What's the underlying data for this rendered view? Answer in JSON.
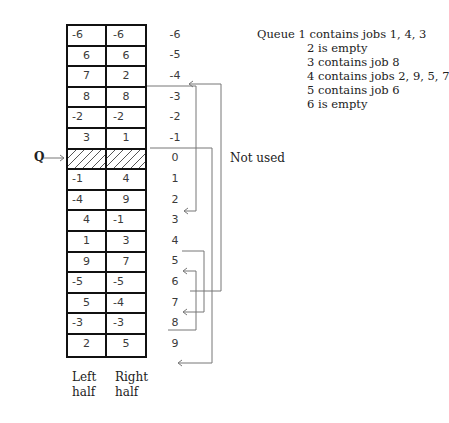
{
  "diagram": {
    "pointer_label": "Q",
    "not_used_label": "Not used",
    "column_labels": {
      "left": [
        "Left",
        "half"
      ],
      "right": [
        "Right",
        "half"
      ]
    },
    "rows": [
      {
        "index": "-6",
        "left": "-6",
        "right": "-6"
      },
      {
        "index": "-5",
        "left": "6",
        "right": "6"
      },
      {
        "index": "-4",
        "left": "7",
        "right": "2"
      },
      {
        "index": "-3",
        "left": "8",
        "right": "8"
      },
      {
        "index": "-2",
        "left": "-2",
        "right": "-2"
      },
      {
        "index": "-1",
        "left": "3",
        "right": "1"
      },
      {
        "index": "0",
        "left": "",
        "right": "",
        "hatched": true
      },
      {
        "index": "1",
        "left": "-1",
        "right": "4"
      },
      {
        "index": "2",
        "left": "-4",
        "right": "9"
      },
      {
        "index": "3",
        "left": "4",
        "right": "-1"
      },
      {
        "index": "4",
        "left": "1",
        "right": "3"
      },
      {
        "index": "5",
        "left": "9",
        "right": "7"
      },
      {
        "index": "6",
        "left": "-5",
        "right": "-5"
      },
      {
        "index": "7",
        "left": "5",
        "right": "-4"
      },
      {
        "index": "8",
        "left": "-3",
        "right": "-3"
      },
      {
        "index": "9",
        "left": "2",
        "right": "5"
      }
    ],
    "links": [
      {
        "from": "-3",
        "to": "3"
      },
      {
        "from": "0",
        "to": "9"
      },
      {
        "from": "6",
        "to": "-4"
      },
      {
        "from": "4",
        "to": "8"
      },
      {
        "from": "8",
        "to": "5"
      }
    ]
  },
  "legend": {
    "lines": [
      {
        "prefix": "Queue ",
        "text": "1 contains jobs 1, 4, 3"
      },
      {
        "prefix": "",
        "text": "2 is empty"
      },
      {
        "prefix": "",
        "text": "3 contains job 8"
      },
      {
        "prefix": "",
        "text": "4 contains jobs 2, 9, 5, 7"
      },
      {
        "prefix": "",
        "text": "5 contains job 6"
      },
      {
        "prefix": "",
        "text": "6 is empty"
      }
    ]
  },
  "colors": {
    "border": "#111111",
    "text": "#2a2a2a",
    "line": "#777777"
  }
}
